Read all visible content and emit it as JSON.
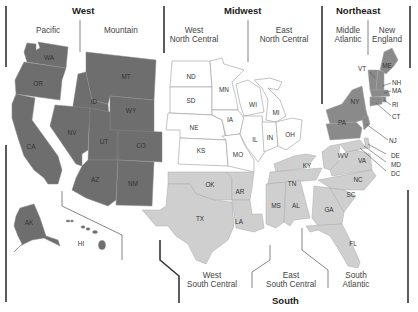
{
  "regions": {
    "west": {
      "title": "West",
      "fill": "#6e6e6e"
    },
    "midwest": {
      "title": "Midwest",
      "fill": "#ffffff"
    },
    "northeast": {
      "title": "Northeast",
      "fill": "#8a8a8a"
    },
    "south": {
      "title": "South",
      "fill": "#cfcfcf"
    }
  },
  "divisions": {
    "pacific": "Pacific",
    "mountain": "Mountain",
    "west_north_central": [
      "West",
      "North Central"
    ],
    "east_north_central": [
      "East",
      "North Central"
    ],
    "middle_atlantic": [
      "Middle",
      "Atlantic"
    ],
    "new_england": [
      "New",
      "England"
    ],
    "west_south_central": [
      "West",
      "South Central"
    ],
    "east_south_central": [
      "East",
      "South Central"
    ],
    "south_atlantic": [
      "South",
      "Atlantic"
    ]
  },
  "states": {
    "pacific": [
      "WA",
      "OR",
      "CA",
      "AK",
      "HI"
    ],
    "mountain": [
      "MT",
      "ID",
      "WY",
      "NV",
      "UT",
      "CO",
      "AZ",
      "NM"
    ],
    "west_north_central": [
      "ND",
      "SD",
      "NE",
      "KS",
      "MN",
      "IA",
      "MO"
    ],
    "east_north_central": [
      "WI",
      "MI",
      "IL",
      "IN",
      "OH"
    ],
    "middle_atlantic": [
      "NY",
      "PA",
      "NJ"
    ],
    "new_england": [
      "ME",
      "VT",
      "NH",
      "MA",
      "RI",
      "CT"
    ],
    "west_south_central": [
      "OK",
      "TX",
      "AR",
      "LA"
    ],
    "east_south_central": [
      "KY",
      "TN",
      "MS",
      "AL"
    ],
    "south_atlantic": [
      "WV",
      "VA",
      "DE",
      "MD",
      "DC",
      "NC",
      "SC",
      "GA",
      "FL"
    ]
  }
}
